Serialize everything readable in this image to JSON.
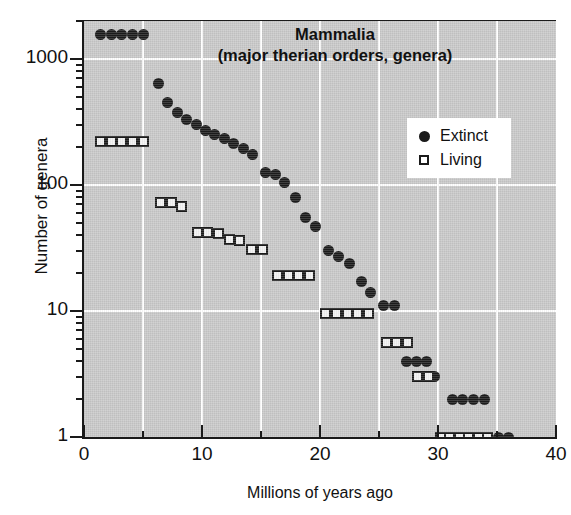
{
  "chart_data": {
    "type": "scatter",
    "title": "Mammalia",
    "subtitle": "(major therian orders, genera)",
    "xlabel": "Millions of years ago",
    "ylabel": "Number of genera",
    "xlim": [
      0,
      40
    ],
    "ylim": [
      1,
      2000
    ],
    "yscale": "log",
    "xticks": [
      0,
      10,
      20,
      30,
      40
    ],
    "xtick_labels": [
      "0",
      "10",
      "20",
      "30",
      "40"
    ],
    "xticks_minor": [
      5,
      15,
      25,
      35
    ],
    "yticks": [
      1,
      10,
      100,
      1000
    ],
    "ytick_labels": [
      "1",
      "10",
      "100",
      "1000"
    ],
    "grid": true,
    "legend_position": "upper right",
    "plot_background": "#c9c9c9",
    "marker_color": "#1b1b1b",
    "series": [
      {
        "name": "Extinct",
        "marker": "filled-circle",
        "points": [
          [
            1.4,
            1550
          ],
          [
            2.3,
            1550
          ],
          [
            3.2,
            1550
          ],
          [
            4.1,
            1550
          ],
          [
            5.0,
            1550
          ],
          [
            6.3,
            640
          ],
          [
            7.1,
            455
          ],
          [
            7.9,
            375
          ],
          [
            8.7,
            330
          ],
          [
            9.5,
            300
          ],
          [
            10.3,
            270
          ],
          [
            11.1,
            250
          ],
          [
            11.9,
            235
          ],
          [
            12.7,
            215
          ],
          [
            13.5,
            195
          ],
          [
            14.3,
            175
          ],
          [
            15.4,
            125
          ],
          [
            16.2,
            120
          ],
          [
            17.0,
            105
          ],
          [
            17.9,
            80
          ],
          [
            18.8,
            55
          ],
          [
            19.6,
            47
          ],
          [
            20.7,
            30
          ],
          [
            21.6,
            27
          ],
          [
            22.5,
            24
          ],
          [
            23.5,
            17
          ],
          [
            24.3,
            14
          ],
          [
            25.4,
            11
          ],
          [
            26.3,
            11
          ],
          [
            27.3,
            4
          ],
          [
            28.2,
            4
          ],
          [
            29.0,
            4
          ],
          [
            29.7,
            3
          ],
          [
            31.2,
            2
          ],
          [
            32.1,
            2
          ],
          [
            33.0,
            2
          ],
          [
            33.9,
            2
          ],
          [
            35.1,
            1
          ],
          [
            36.0,
            1
          ]
        ]
      },
      {
        "name": "Living",
        "marker": "open-square",
        "points": [
          [
            1.4,
            220
          ],
          [
            2.3,
            220
          ],
          [
            3.2,
            220
          ],
          [
            4.1,
            220
          ],
          [
            5.0,
            220
          ],
          [
            6.5,
            72
          ],
          [
            7.4,
            72
          ],
          [
            8.3,
            67
          ],
          [
            9.6,
            42
          ],
          [
            10.5,
            42
          ],
          [
            11.4,
            41
          ],
          [
            12.3,
            37
          ],
          [
            13.2,
            36
          ],
          [
            14.2,
            31
          ],
          [
            15.1,
            31
          ],
          [
            16.4,
            19
          ],
          [
            17.3,
            19
          ],
          [
            18.2,
            19
          ],
          [
            19.1,
            19
          ],
          [
            20.5,
            9.5
          ],
          [
            21.4,
            9.5
          ],
          [
            22.3,
            9.5
          ],
          [
            23.2,
            9.5
          ],
          [
            24.1,
            9.5
          ],
          [
            25.6,
            5.6
          ],
          [
            26.5,
            5.6
          ],
          [
            27.4,
            5.6
          ],
          [
            28.3,
            3
          ],
          [
            29.2,
            3
          ],
          [
            30.2,
            1
          ],
          [
            31.0,
            1
          ],
          [
            31.8,
            1
          ],
          [
            32.6,
            1
          ],
          [
            33.4,
            1
          ],
          [
            34.2,
            1
          ]
        ]
      }
    ]
  },
  "legend": {
    "items": [
      {
        "label": "Extinct",
        "marker": "filled-circle"
      },
      {
        "label": "Living",
        "marker": "open-square"
      }
    ]
  }
}
